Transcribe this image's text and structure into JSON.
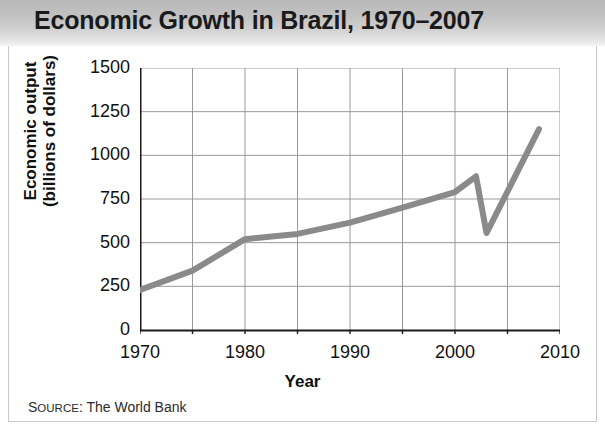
{
  "header": {
    "title": "Economic Growth in Brazil, 1970–2007"
  },
  "source": {
    "label_caps": "S",
    "label_small": "OURCE",
    "label_rest": ": The World Bank",
    "full": "SOURCE: The World Bank"
  },
  "colors": {
    "line": "#8a8a8a",
    "axis": "#1a1a1a",
    "grid": "#9a9a9a",
    "title_band_top": "#b9b9b9",
    "title_band_bottom": "#f4f4f4",
    "text": "#111111",
    "background": "#ffffff"
  },
  "chart_data": {
    "type": "line",
    "title": "Economic Growth in Brazil, 1970–2007",
    "xlabel": "Year",
    "ylabel": "Economic output (billions of dollars)",
    "ylabel_line1": "Economic output",
    "ylabel_line2": "(billions of dollars)",
    "xlim": [
      1970,
      2010
    ],
    "ylim": [
      0,
      1500
    ],
    "ytick_step": 250,
    "xtick_step": 10,
    "xtick_minor_step": 5,
    "grid": true,
    "legend": false,
    "yticks": [
      0,
      250,
      500,
      750,
      1000,
      1250,
      1500
    ],
    "ytick_labels": [
      "0",
      "250",
      "500",
      "750",
      "1000",
      "1250",
      "1500"
    ],
    "xticks": [
      1970,
      1980,
      1990,
      2000,
      2010
    ],
    "xtick_labels": [
      "1970",
      "1980",
      "1990",
      "2000",
      "2010"
    ],
    "xticks_minor": [
      1975,
      1985,
      1995,
      2005
    ],
    "series": [
      {
        "name": "Economic output",
        "x": [
          1970,
          1975,
          1980,
          1985,
          1990,
          1995,
          2000,
          2002,
          2003,
          2008
        ],
        "values": [
          230,
          340,
          520,
          550,
          615,
          700,
          790,
          880,
          555,
          1150
        ]
      }
    ]
  }
}
